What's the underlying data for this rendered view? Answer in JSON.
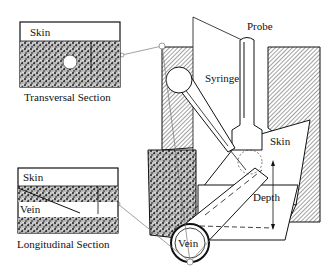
{
  "diagram": {
    "labels": {
      "probe": "Probe",
      "syringe": "Syringe",
      "skin_main": "Skin",
      "vein_main": "Vein",
      "depth": "Depth"
    },
    "inset_transversal": {
      "skin_label": "Skin",
      "caption": "Transversal Section"
    },
    "inset_longitudinal": {
      "skin_label": "Skin",
      "vein_label": "Vein",
      "caption": "Longitudinal Section"
    },
    "colors": {
      "ink": "#111111",
      "hatch": "#555555",
      "tissue": "#444444",
      "background": "#ffffff"
    }
  }
}
